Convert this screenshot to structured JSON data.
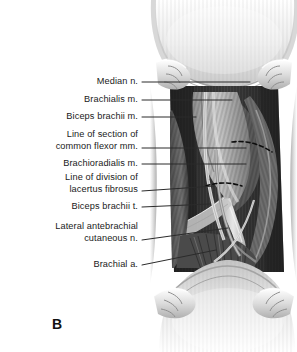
{
  "figure": {
    "panel_letter": "B",
    "background_color": "#ffffff",
    "ink_color": "#1a1a1a"
  },
  "labels": [
    {
      "name": "median-nerve",
      "lines": [
        "Median n."
      ],
      "text_right_x": 138,
      "baseline_y": 85,
      "leader": {
        "x1": 142,
        "y1": 82,
        "x2": 250,
        "y2": 82
      }
    },
    {
      "name": "brachialis-muscle",
      "lines": [
        "Brachialis m."
      ],
      "text_right_x": 138,
      "baseline_y": 103,
      "leader": {
        "x1": 142,
        "y1": 100,
        "x2": 232,
        "y2": 100
      }
    },
    {
      "name": "biceps-brachii-muscle",
      "lines": [
        "Biceps brachii m."
      ],
      "text_right_x": 138,
      "baseline_y": 120,
      "leader": {
        "x1": 142,
        "y1": 117,
        "x2": 196,
        "y2": 117
      }
    },
    {
      "name": "line-of-section-of-common-flexor-muscles",
      "lines": [
        "Line of section of",
        "common flexor mm."
      ],
      "text_right_x": 138,
      "baseline_y": 138,
      "leader": {
        "x1": 142,
        "y1": 148,
        "x2": 246,
        "y2": 148
      }
    },
    {
      "name": "brachioradialis-muscle",
      "lines": [
        "Brachioradialis m."
      ],
      "text_right_x": 138,
      "baseline_y": 167,
      "leader": {
        "x1": 142,
        "y1": 164,
        "x2": 246,
        "y2": 164
      }
    },
    {
      "name": "line-of-division-of-lacertus-fibrosus",
      "lines": [
        "Line of division of",
        "lacertus fibrosus"
      ],
      "text_right_x": 138,
      "baseline_y": 181,
      "leader": {
        "x1": 142,
        "y1": 191,
        "x2": 214,
        "y2": 186
      }
    },
    {
      "name": "biceps-brachii-tendon",
      "lines": [
        "Biceps brachii t."
      ],
      "text_right_x": 138,
      "baseline_y": 210,
      "leader": {
        "x1": 142,
        "y1": 207,
        "x2": 210,
        "y2": 204
      }
    },
    {
      "name": "lateral-antebrachial-cutaneous-nerve",
      "lines": [
        "Lateral antebrachial",
        "cutaneous n."
      ],
      "text_right_x": 138,
      "baseline_y": 230,
      "leader": {
        "x1": 142,
        "y1": 240,
        "x2": 228,
        "y2": 228
      }
    },
    {
      "name": "brachial-artery",
      "lines": [
        "Brachial a."
      ],
      "text_right_x": 138,
      "baseline_y": 268,
      "leader": {
        "x1": 142,
        "y1": 265,
        "x2": 216,
        "y2": 250
      }
    }
  ],
  "colors": {
    "skin_light": "#ececec",
    "skin_mid": "#d6d6d6",
    "skin_shadow": "#b9b9b9",
    "muscle_dark": "#3a3a3a",
    "muscle_darker": "#262626",
    "muscle_mid": "#6a6a6a",
    "tendon_light": "#d9d9d9",
    "fascia": "#9a9a9a",
    "incision_dash": "#0d0d0d",
    "leader_line": "#2b2b2b"
  }
}
